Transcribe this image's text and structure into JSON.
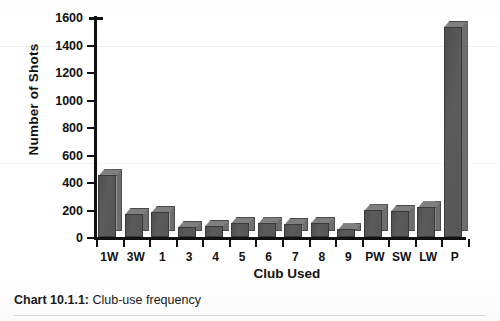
{
  "chart_data": {
    "type": "bar",
    "title": "",
    "xlabel": "Club Used",
    "ylabel": "Number of Shots",
    "categories": [
      "1W",
      "3W",
      "1",
      "3",
      "4",
      "5",
      "6",
      "7",
      "8",
      "9",
      "PW",
      "SW",
      "LW",
      "P"
    ],
    "values": [
      450,
      170,
      185,
      75,
      80,
      105,
      100,
      95,
      105,
      55,
      195,
      190,
      215,
      1530
    ],
    "ylim": [
      0,
      1600
    ],
    "ytick_values": [
      0,
      200,
      400,
      600,
      800,
      1000,
      1200,
      1400,
      1600
    ],
    "ytick_labels": [
      "0",
      "200",
      "400",
      "600",
      "800",
      "1000",
      "1200",
      "1400",
      "1600"
    ],
    "grid": false,
    "legend": "none",
    "bar_style": "3d-extruded",
    "bar_color": "#555555",
    "bar_top_color": "#7f7f7f",
    "bar_side_color": "#6e6e6e",
    "axis_color": "#111111"
  },
  "caption": {
    "label": "Chart 10.1.1:",
    "text": " Club-use frequency"
  }
}
